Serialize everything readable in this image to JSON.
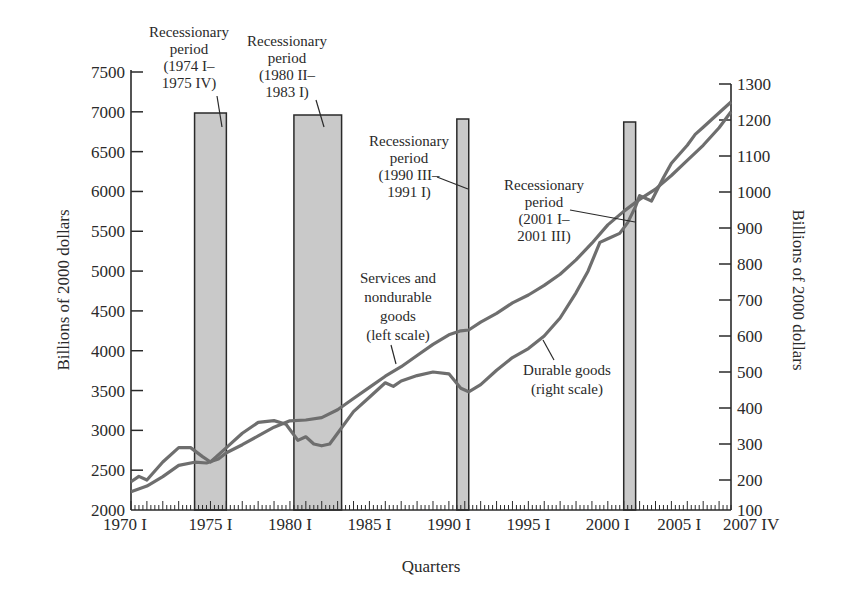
{
  "chart_data": {
    "type": "line",
    "title": "",
    "xlabel": "Quarters",
    "ylabel_left": "Billions of 2000 dollars",
    "ylabel_right": "Billions of 2000 dollars",
    "ylim_left": [
      2000,
      7500
    ],
    "ylim_right": [
      100,
      1300
    ],
    "x_range": [
      "1970 I",
      "2007 IV"
    ],
    "x_tick_labels": [
      "1970 I",
      "1975 I",
      "1980 I",
      "1985 I",
      "1990 I",
      "1995 I",
      "2000 I",
      "2005 I",
      "2007 IV"
    ],
    "x_tick_years": [
      1970,
      1975,
      1980,
      1985,
      1990,
      1995,
      2000,
      2005,
      2007.75
    ],
    "y_left_ticks": [
      2000,
      2500,
      3000,
      3500,
      4000,
      4500,
      5000,
      5500,
      6000,
      6500,
      7000,
      7500
    ],
    "y_right_ticks": [
      100,
      200,
      300,
      400,
      500,
      600,
      700,
      800,
      900,
      1000,
      1100,
      1200,
      1300
    ],
    "grid": false,
    "legend": "inline annotations",
    "series": [
      {
        "name": "Services and nondurable goods",
        "axis": "left",
        "annotation": [
          "Services and",
          "nondurable",
          "goods",
          "(left scale)"
        ],
        "x": [
          1970,
          1971,
          1972,
          1973,
          1974,
          1974.75,
          1975.5,
          1976,
          1977,
          1978,
          1979,
          1980,
          1981,
          1982,
          1983,
          1984,
          1985,
          1986,
          1987,
          1988,
          1989,
          1990,
          1990.75,
          1991.25,
          1992,
          1993,
          1994,
          1995,
          1996,
          1997,
          1998,
          1999,
          2000,
          2001,
          2002,
          2003,
          2004,
          2005,
          2006,
          2007,
          2007.75
        ],
        "values": [
          2230,
          2300,
          2420,
          2560,
          2600,
          2590,
          2640,
          2720,
          2820,
          2930,
          3040,
          3120,
          3130,
          3160,
          3260,
          3400,
          3540,
          3680,
          3800,
          3940,
          4080,
          4200,
          4250,
          4260,
          4360,
          4470,
          4600,
          4700,
          4820,
          4960,
          5140,
          5350,
          5580,
          5750,
          5900,
          6030,
          6200,
          6390,
          6580,
          6800,
          7000
        ]
      },
      {
        "name": "Durable goods",
        "axis": "right",
        "annotation": [
          "Durable goods",
          "(right scale)"
        ],
        "x": [
          1970,
          1970.5,
          1971,
          1972,
          1973,
          1973.75,
          1974.5,
          1975,
          1976,
          1977,
          1978,
          1979,
          1979.75,
          1980.5,
          1981,
          1981.5,
          1982,
          1982.5,
          1983,
          1984,
          1985,
          1986,
          1986.5,
          1987,
          1988,
          1989,
          1990,
          1990.75,
          1991.25,
          1992,
          1993,
          1994,
          1995,
          1996,
          1997,
          1998,
          1998.75,
          1999.5,
          2000,
          2000.75,
          2001.25,
          2001.75,
          2002,
          2002.75,
          2003.5,
          2004,
          2005,
          2005.5,
          2006,
          2007,
          2007.75
        ],
        "values": [
          195,
          210,
          200,
          250,
          290,
          290,
          265,
          250,
          290,
          330,
          360,
          365,
          355,
          310,
          320,
          300,
          295,
          300,
          330,
          390,
          430,
          470,
          460,
          475,
          490,
          500,
          495,
          455,
          445,
          465,
          505,
          540,
          565,
          600,
          650,
          720,
          780,
          860,
          870,
          885,
          915,
          960,
          990,
          975,
          1040,
          1080,
          1130,
          1160,
          1180,
          1220,
          1250
        ]
      }
    ],
    "recessions": [
      {
        "start": 1974.0,
        "end": 1975.75,
        "label": [
          "Recessionary",
          "period",
          "(1974 I–",
          "1975 IV)"
        ]
      },
      {
        "start": 1980.25,
        "end": 1983.0,
        "label": [
          "Recessionary",
          "period",
          "(1980 II–",
          "1983 I)"
        ]
      },
      {
        "start": 1990.5,
        "end": 1991.0,
        "label": [
          "Recessionary",
          "period",
          "(1990 III–",
          "1991 I)"
        ]
      },
      {
        "start": 2001.0,
        "end": 2001.5,
        "label": [
          "Recessionary",
          "period",
          "(2001 I–",
          "2001 III)"
        ]
      }
    ]
  },
  "colors": {
    "line": "#6e6e6e",
    "recession_fill": "#c9c9c9",
    "axis": "#2a2a2a",
    "text": "#2a2a2a"
  }
}
